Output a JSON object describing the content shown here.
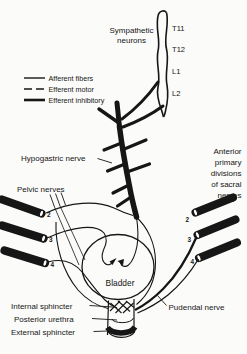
{
  "colors": {
    "background": "#fbfbf9",
    "ink": "#161616"
  },
  "legend": {
    "items": [
      {
        "label": "Afferent fibers",
        "style": "solid-thin"
      },
      {
        "label": "Efferent motor",
        "style": "dashed"
      },
      {
        "label": "Efferent inhibitory",
        "style": "solid-thick"
      }
    ]
  },
  "spine": {
    "label_line1": "Sympathetic",
    "label_line2": "neurons",
    "segments": [
      "T11",
      "T12",
      "L1",
      "L2"
    ]
  },
  "nerves": {
    "hypogastric": "Hypogastric nerve",
    "pelvic": "Pelvic nerves",
    "pudendal": "Pudendal nerve",
    "sacral_lines": [
      "Anterior",
      "primary",
      "divisions",
      "of sacral",
      "nerves"
    ]
  },
  "organs": {
    "bladder": "Bladder",
    "internal_sphincter": "Internal sphincter",
    "posterior_urethra": "Posterior urethra",
    "external_sphincter": "External sphincter"
  },
  "roots": {
    "left": [
      "2",
      "3",
      "4"
    ],
    "right": [
      "2",
      "3",
      "4"
    ]
  }
}
